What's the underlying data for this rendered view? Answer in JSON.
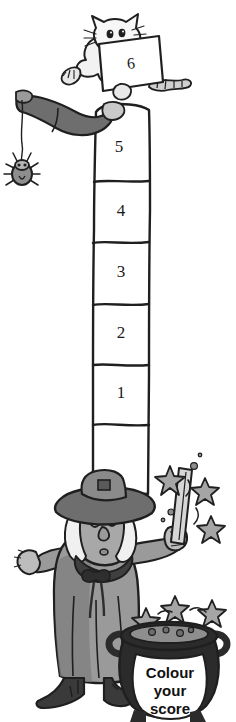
{
  "page": {
    "title": "Colour your score",
    "background_color": "#ffffff",
    "width": 236,
    "height": 722
  },
  "palette": {
    "ink": "#1a1a1a",
    "outline": "#222222",
    "white": "#ffffff",
    "light_grey": "#c9c9c9",
    "mid_grey": "#9a9a9a",
    "robe_grey": "#8e8e8e",
    "dark_grey": "#5e5e5e",
    "near_black": "#3a3a3a",
    "cauldron_black": "#2b2b2b",
    "star_grey": "#a5a5a5"
  },
  "score_column": {
    "name": "score-ladder",
    "orientation": "vertical",
    "segments": [
      {
        "label": "5",
        "top": 110,
        "bottom": 182
      },
      {
        "label": "4",
        "top": 182,
        "bottom": 243
      },
      {
        "label": "3",
        "top": 243,
        "bottom": 305
      },
      {
        "label": "2",
        "top": 305,
        "bottom": 365
      },
      {
        "label": "1",
        "top": 365,
        "bottom": 425
      }
    ],
    "extra_segment_label": ""
  },
  "card": {
    "name": "cat-score-card",
    "value": "6"
  },
  "cauldron": {
    "name": "cauldron-label",
    "lines": [
      "Colour",
      "your",
      "score"
    ]
  },
  "characters": {
    "cat": "cat-holding-card",
    "spider": "hanging-spider",
    "wizard": "wizard-with-wand",
    "wand": "magic-wand",
    "stars": "sparkle-stars"
  }
}
